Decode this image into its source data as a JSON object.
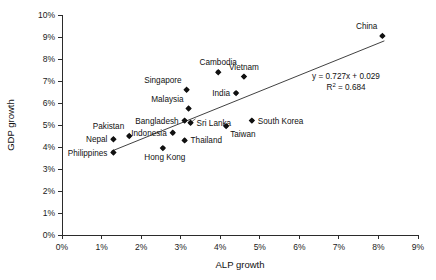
{
  "chart_data": {
    "type": "scatter",
    "title": "",
    "xlabel": "ALP growth",
    "ylabel": "GDP growth",
    "xlim": [
      0,
      9
    ],
    "ylim": [
      0,
      10
    ],
    "grid": false,
    "legend": null,
    "x_ticks": [
      "0%",
      "1%",
      "2%",
      "3%",
      "4%",
      "5%",
      "6%",
      "7%",
      "8%",
      "9%"
    ],
    "y_ticks": [
      "0%",
      "1%",
      "2%",
      "3%",
      "4%",
      "5%",
      "6%",
      "7%",
      "8%",
      "9%",
      "10%"
    ],
    "x_tick_values": [
      0,
      1,
      2,
      3,
      4,
      5,
      6,
      7,
      8,
      9
    ],
    "y_tick_values": [
      0,
      1,
      2,
      3,
      4,
      5,
      6,
      7,
      8,
      9,
      10
    ],
    "points": [
      {
        "label": "China",
        "x": 8.1,
        "y": 9.05,
        "label_pos": "above-left"
      },
      {
        "label": "Cambodia",
        "x": 3.95,
        "y": 7.4,
        "label_pos": "above"
      },
      {
        "label": "Vietnam",
        "x": 4.6,
        "y": 7.2,
        "label_pos": "above"
      },
      {
        "label": "Singapore",
        "x": 3.15,
        "y": 6.6,
        "label_pos": "above-left"
      },
      {
        "label": "India",
        "x": 4.4,
        "y": 6.45,
        "label_pos": "left"
      },
      {
        "label": "Malaysia",
        "x": 3.2,
        "y": 5.75,
        "label_pos": "above-left"
      },
      {
        "label": "South Korea",
        "x": 4.8,
        "y": 5.2,
        "label_pos": "right"
      },
      {
        "label": "Bangladesh",
        "x": 3.1,
        "y": 5.2,
        "label_pos": "left"
      },
      {
        "label": "Sri Lanka",
        "x": 3.25,
        "y": 5.1,
        "label_pos": "right"
      },
      {
        "label": "Taiwan",
        "x": 4.15,
        "y": 4.95,
        "label_pos": "below-right"
      },
      {
        "label": "Indonesia",
        "x": 2.8,
        "y": 4.65,
        "label_pos": "left"
      },
      {
        "label": "Pakistan",
        "x": 1.7,
        "y": 4.5,
        "label_pos": "above-left"
      },
      {
        "label": "Nepal",
        "x": 1.3,
        "y": 4.35,
        "label_pos": "left"
      },
      {
        "label": "Thailand",
        "x": 3.1,
        "y": 4.3,
        "label_pos": "right"
      },
      {
        "label": "Hong Kong",
        "x": 2.55,
        "y": 3.95,
        "label_pos": "below-left"
      },
      {
        "label": "Philippines",
        "x": 1.3,
        "y": 3.75,
        "label_pos": "left"
      }
    ],
    "trendline": {
      "slope": 0.727,
      "intercept": 0.029,
      "x_start": 1.25,
      "x_end": 8.15,
      "equation": "y = 0.727x + 0.029",
      "r_squared_label": "R",
      "r_squared_sup": "2",
      "r_squared_value": " = 0.684"
    }
  },
  "annotations": {
    "equation_line1": "y = 0.727x + 0.029",
    "equation_line2_prefix": "R",
    "equation_line2_sup": "2",
    "equation_line2_suffix": " = 0.684"
  },
  "axes": {
    "x_title": "ALP growth",
    "y_title": "GDP growth"
  }
}
